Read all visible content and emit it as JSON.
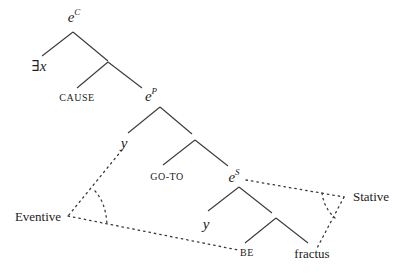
{
  "diagram": {
    "type": "syntactic-tree",
    "nodes": {
      "eC": {
        "base": "e",
        "sup": "C"
      },
      "exists_x": "∃x",
      "cause": "CAUSE",
      "eP": {
        "base": "e",
        "sup": "P"
      },
      "y1": "y",
      "goto": "GO-TO",
      "eS": {
        "base": "e",
        "sup": "S"
      },
      "y2": "y",
      "be": "BE",
      "fractus": "fractus"
    },
    "annotations": {
      "eventive": "Eventive",
      "stative": "Stative"
    },
    "colors": {
      "line": "#3a3a3a",
      "text": "#222222"
    }
  }
}
